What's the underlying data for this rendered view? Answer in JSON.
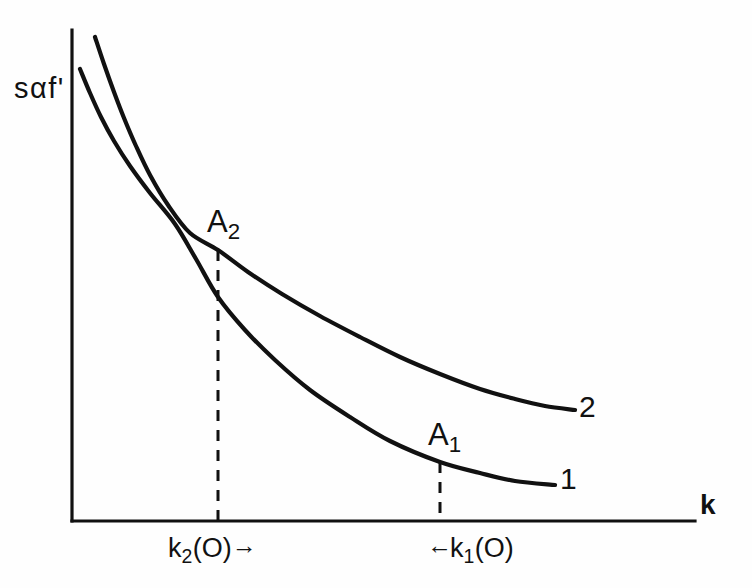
{
  "figure": {
    "background_color": "#fefefe",
    "ink_color": "#111111",
    "y_axis_label": "sαf'",
    "x_axis_label": "k",
    "curve_labels": {
      "upper": "2",
      "lower": "1"
    },
    "point_labels": {
      "upper": "A",
      "upper_sub": "2",
      "lower": "A",
      "lower_sub": "1"
    },
    "tick_labels": {
      "left": {
        "symbol": "k",
        "sub": "2",
        "arg": "(O)",
        "arrow": "→",
        "arrow_side": "right"
      },
      "right": {
        "symbol": "k",
        "sub": "1",
        "arg": "(O)",
        "arrow": "←",
        "arrow_side": "left"
      }
    }
  },
  "chart_data": {
    "type": "line",
    "title": "",
    "xlabel": "k",
    "ylabel": "sαf'",
    "grid": false,
    "legend": "inline-end-labels",
    "axis_origin_px": [
      72,
      521
    ],
    "x_axis_end_px": [
      695,
      521
    ],
    "y_axis_top_px": [
      72,
      30
    ],
    "xlim": [
      0,
      1
    ],
    "ylim": [
      0,
      1
    ],
    "series": [
      {
        "name": "2",
        "label": "2",
        "points_px": [
          [
            95,
            37
          ],
          [
            104,
            64
          ],
          [
            114,
            92
          ],
          [
            124,
            118
          ],
          [
            136,
            146
          ],
          [
            150,
            175
          ],
          [
            168,
            205
          ],
          [
            190,
            233
          ],
          [
            218,
            250
          ],
          [
            248,
            272
          ],
          [
            282,
            294
          ],
          [
            320,
            316
          ],
          [
            360,
            337
          ],
          [
            400,
            357
          ],
          [
            440,
            374
          ],
          [
            480,
            389
          ],
          [
            515,
            399
          ],
          [
            545,
            406
          ],
          [
            575,
            410
          ]
        ],
        "marked_point": {
          "name": "A2",
          "px": [
            218,
            250
          ]
        }
      },
      {
        "name": "1",
        "label": "1",
        "points_px": [
          [
            80,
            69
          ],
          [
            90,
            93
          ],
          [
            101,
            117
          ],
          [
            114,
            141
          ],
          [
            130,
            166
          ],
          [
            150,
            193
          ],
          [
            175,
            224
          ],
          [
            196,
            259
          ],
          [
            218,
            297
          ],
          [
            245,
            330
          ],
          [
            275,
            360
          ],
          [
            310,
            390
          ],
          [
            350,
            417
          ],
          [
            390,
            441
          ],
          [
            440,
            462
          ],
          [
            480,
            473
          ],
          [
            515,
            481
          ],
          [
            555,
            485
          ]
        ],
        "marked_point": {
          "name": "A1",
          "px": [
            440,
            462
          ]
        }
      }
    ],
    "dashed_drops": [
      {
        "name": "k2(O)",
        "x_px": 218,
        "y_top_px": 250,
        "y_bottom_px": 521
      },
      {
        "name": "k1(O)",
        "x_px": 440,
        "y_top_px": 462,
        "y_bottom_px": 521
      }
    ]
  }
}
